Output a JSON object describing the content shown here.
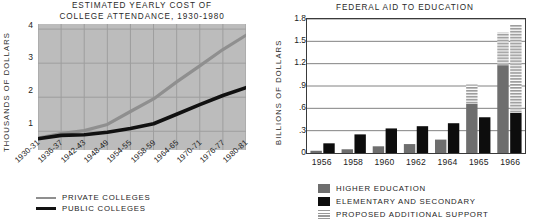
{
  "chart_data": [
    {
      "type": "line",
      "title": "ESTIMATED YEARLY COST OF\nCOLLEGE ATTENDANCE, 1930-1980",
      "xlabel": "",
      "ylabel": "THOUSANDS OF DOLLARS",
      "ylim": [
        0.45,
        4.15
      ],
      "yticks": [
        "1",
        "2",
        "3",
        "4"
      ],
      "ytick_values": [
        1,
        2,
        3,
        4
      ],
      "categories": [
        "1930-31",
        "1936-37",
        "1942-43",
        "1948-49",
        "1954-55",
        "1958-59",
        "1964-65",
        "1970-71",
        "1976-77",
        "1980-81"
      ],
      "grid": true,
      "plot_background": "#bcbcbc",
      "legend_position": "below",
      "series": [
        {
          "name": "PRIVATE COLLEGES",
          "color": "#8c8c8c",
          "values": [
            0.8,
            0.93,
            1.02,
            1.2,
            1.58,
            1.95,
            2.45,
            2.92,
            3.4,
            3.82
          ]
        },
        {
          "name": "PUBLIC COLLEGES",
          "color": "#111111",
          "values": [
            0.78,
            0.88,
            0.9,
            0.97,
            1.08,
            1.22,
            1.5,
            1.78,
            2.05,
            2.28
          ]
        }
      ]
    },
    {
      "type": "bar",
      "title": "FEDERAL AID TO EDUCATION",
      "xlabel": "",
      "ylabel": "BILLIONS OF DOLLARS",
      "ylim": [
        0,
        1.8
      ],
      "yticks": [
        "0",
        ".3",
        ".6",
        ".9",
        "1.2",
        "1.5",
        "1.8"
      ],
      "ytick_values": [
        0,
        0.3,
        0.6,
        0.9,
        1.2,
        1.5,
        1.8
      ],
      "categories": [
        "1956",
        "1958",
        "1960",
        "1962",
        "1964",
        "1965",
        "1966"
      ],
      "grid": true,
      "plot_background": "#ffffff",
      "legend_position": "below",
      "series": [
        {
          "name": "HIGHER EDUCATION",
          "color": "#6e6e6e",
          "pattern": "solid",
          "values": [
            0.03,
            0.05,
            0.09,
            0.12,
            0.18,
            0.66,
            1.18
          ]
        },
        {
          "name": "ELEMENTARY AND SECONDARY",
          "color": "#0d0d0d",
          "pattern": "solid",
          "values": [
            0.13,
            0.25,
            0.33,
            0.36,
            0.4,
            0.48,
            0.54
          ]
        },
        {
          "name": "PROPOSED ADDITIONAL SUPPORT",
          "color": "#9a9a9a",
          "pattern": "horizontal-stripes",
          "values": [
            0,
            0,
            0,
            0,
            0,
            0,
            0
          ],
          "stacked_on": {
            "HIGHER EDUCATION": [
              0,
              0,
              0,
              0,
              0,
              0.26,
              0.44
            ],
            "ELEMENTARY AND SECONDARY": [
              0,
              0,
              0,
              0,
              0,
              0,
              1.18
            ]
          }
        }
      ]
    }
  ],
  "left_chart": {
    "title_line1": "ESTIMATED YEARLY COST OF",
    "title_line2": "COLLEGE ATTENDANCE, 1930-1980",
    "ylabel": "THOUSANDS OF DOLLARS",
    "yticks": [
      "4",
      "3",
      "2",
      "1"
    ],
    "xticks": [
      "1930-31",
      "1936-37",
      "1942-43",
      "1948-49",
      "1954-55",
      "1958-59",
      "1964-65",
      "1970-71",
      "1976-77",
      "1980-81"
    ],
    "legend": [
      {
        "label": "PRIVATE COLLEGES",
        "color": "#8c8c8c"
      },
      {
        "label": "PUBLIC COLLEGES",
        "color": "#111111"
      }
    ]
  },
  "right_chart": {
    "title": "FEDERAL AID TO EDUCATION",
    "ylabel": "BILLIONS OF DOLLARS",
    "yticks": [
      "1.8",
      "1.5",
      "1.2",
      ".9",
      ".6",
      ".3",
      "0"
    ],
    "xticks": [
      "1956",
      "1958",
      "1960",
      "1962",
      "1964",
      "1965",
      "1966"
    ],
    "legend": [
      {
        "label": "HIGHER EDUCATION",
        "color": "#6e6e6e"
      },
      {
        "label": "ELEMENTARY AND SECONDARY",
        "color": "#0d0d0d"
      },
      {
        "label": "PROPOSED ADDITIONAL SUPPORT",
        "color": "#9a9a9a"
      }
    ]
  }
}
